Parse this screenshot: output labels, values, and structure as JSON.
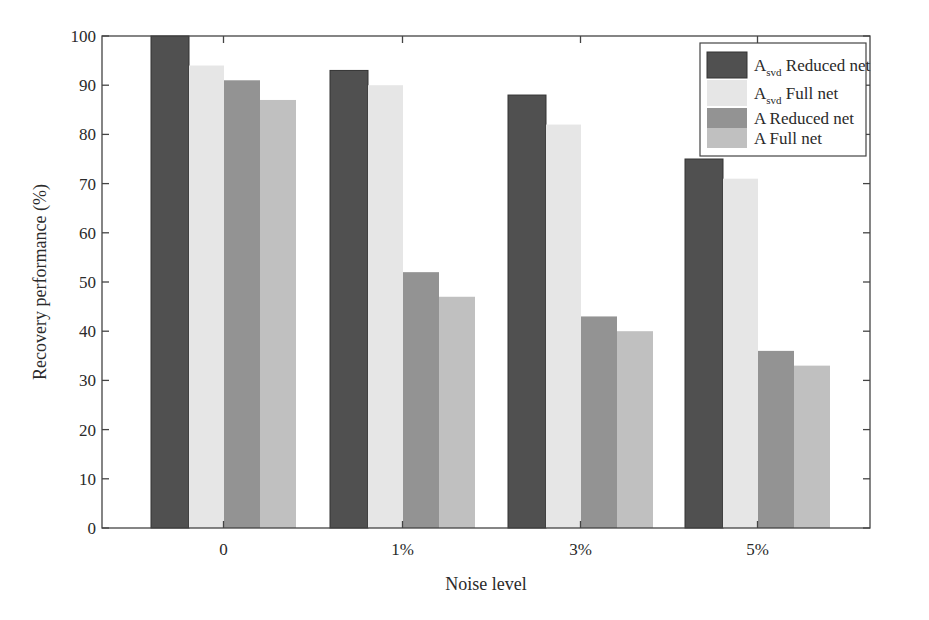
{
  "chart_data": {
    "type": "bar",
    "title": "",
    "xlabel": "Noise level",
    "ylabel": "Recovery performance (%)",
    "ylim": [
      0,
      100
    ],
    "yticks": [
      0,
      10,
      20,
      30,
      40,
      50,
      60,
      70,
      80,
      90,
      100
    ],
    "grid": false,
    "legend_position": "upper right",
    "categories": [
      "0",
      "1%",
      "3%",
      "5%"
    ],
    "series": [
      {
        "name": "A_svd Reduced net",
        "label_main": "A",
        "label_sub": "svd",
        "label_rest": " Reduced net",
        "color": "#505050",
        "values": [
          100,
          93,
          88,
          75
        ]
      },
      {
        "name": "A_svd Full net",
        "label_main": "A",
        "label_sub": "svd",
        "label_rest": " Full net",
        "color": "#e6e6e6",
        "values": [
          94,
          90,
          82,
          71
        ]
      },
      {
        "name": "A Reduced net",
        "label_main": "A",
        "label_sub": "",
        "label_rest": " Reduced net",
        "color": "#939393",
        "values": [
          91,
          52,
          43,
          36
        ]
      },
      {
        "name": "A Full net",
        "label_main": "A",
        "label_sub": "",
        "label_rest": " Full net",
        "color": "#c0c0c0",
        "values": [
          87,
          47,
          40,
          33
        ]
      }
    ]
  }
}
